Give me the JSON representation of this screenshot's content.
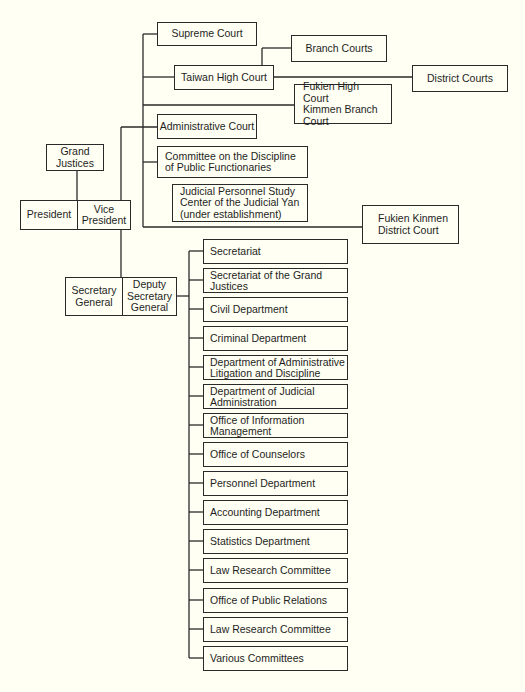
{
  "diagram": {
    "type": "org-chart",
    "background_color": "#fffff3",
    "line_color": "#2a2a2a",
    "leadership": {
      "grand_justices": "Grand\nJustices",
      "president": "President",
      "vice_president": "Vice\nPresident",
      "secretary_general": "Secretary\nGeneral",
      "deputy_secretary_general": "Deputy\nSecretary\nGeneral"
    },
    "courts": {
      "supreme_court": "Supreme Court",
      "taiwan_high_court": "Taiwan High Court",
      "branch_courts": "Branch Courts",
      "district_courts": "District Courts",
      "fukien_high_court_kimmen_branch": "Fukien High Court\nKimmen Branch\nCourt",
      "administrative_court": "Administrative Court",
      "committee_discipline": "Committee on the Discipline\nof Public Functionaries",
      "judicial_personnel_study_center": "Judicial Personnel Study\nCenter of the Judicial Yan\n(under establishment)",
      "fukien_kinmen_district_court": "Fukien Kinmen\nDistrict Court"
    },
    "departments": [
      {
        "label": "Secretariat"
      },
      {
        "label": "Secretariat of the Grand\nJustices"
      },
      {
        "label": "Civil Department"
      },
      {
        "label": "Criminal Department"
      },
      {
        "label": "Department of Administrative\nLitigation and Discipline"
      },
      {
        "label": "Department of Judicial\nAdministration"
      },
      {
        "label": "Office of Information\nManagement"
      },
      {
        "label": "Office of Counselors"
      },
      {
        "label": "Personnel Department"
      },
      {
        "label": "Accounting Department"
      },
      {
        "label": "Statistics Department"
      },
      {
        "label": "Law Research Committee"
      },
      {
        "label": "Office of Public Relations"
      },
      {
        "label": "Law Research Committee"
      },
      {
        "label": "Various Committees"
      }
    ]
  }
}
